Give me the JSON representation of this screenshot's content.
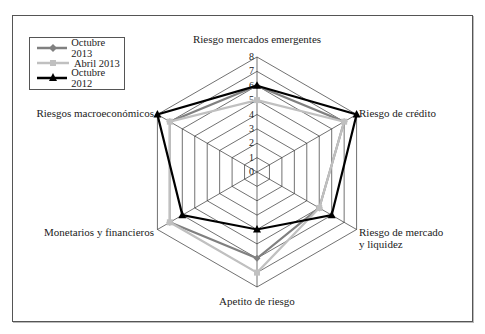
{
  "chart_data": {
    "type": "radar",
    "title": "",
    "axes": [
      "Riesgo mercados emergentes",
      "Riesgo de crédito",
      "Riesgo de mercado y liquidez",
      "Apetito de riesgo",
      "Monetarios y financieros",
      "Riesgos macroeconómicos"
    ],
    "axis_label_lines": [
      [
        "Riesgo mercados emergentes"
      ],
      [
        "Riesgo de crédito"
      ],
      [
        "Riesgo de mercado",
        "y liquidez"
      ],
      [
        "Apetito de riesgo"
      ],
      [
        "Monetarios y financieros"
      ],
      [
        "Riesgos macroeconómicos"
      ]
    ],
    "ticks": [
      "0",
      "1",
      "2",
      "3",
      "4",
      "5",
      "6",
      "7",
      "8"
    ],
    "range": [
      0,
      8
    ],
    "grid": true,
    "legend_position": "top-left",
    "series": [
      {
        "name": "Octubre 2013",
        "values": [
          6,
          7,
          5,
          6,
          7,
          7
        ],
        "color": "#808080",
        "marker": "diamond"
      },
      {
        "name": "Abril 2013",
        "values": [
          5,
          7,
          5,
          7,
          7,
          7
        ],
        "color": "#c0c0c0",
        "marker": "square"
      },
      {
        "name": "Octubre 2012",
        "values": [
          6,
          8,
          6,
          4,
          6,
          8
        ],
        "color": "#000000",
        "marker": "triangle"
      }
    ]
  }
}
